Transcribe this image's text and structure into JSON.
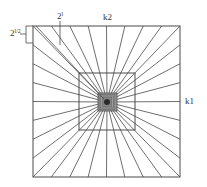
{
  "diagram": {
    "colors": {
      "line": "#4a4a4a",
      "background": "#ffffff",
      "center_fill": "#3a3a3a"
    },
    "outer_square": {
      "x1": 33,
      "y1": 26,
      "x2": 180,
      "y2": 177
    },
    "middle_square": {
      "x1": 79,
      "y1": 73,
      "x2": 135,
      "y2": 130
    },
    "inner_square": {
      "x1": 98,
      "y1": 93,
      "x2": 117,
      "y2": 111
    },
    "center": {
      "x": 107,
      "y": 102
    },
    "rays_per_side": 8,
    "labels": {
      "top_left_base": "2",
      "top_left_exp": "l/2",
      "top_base": "2",
      "top_exp": "l",
      "top_center": "k2",
      "right": "k1"
    }
  }
}
